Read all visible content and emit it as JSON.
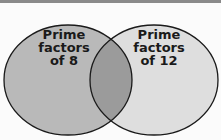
{
  "diagram": {
    "type": "venn",
    "sets": [
      {
        "label_lines": [
          "Prime",
          "factors",
          "of 8"
        ],
        "color": "#b9b9b9"
      },
      {
        "label_lines": [
          "Prime",
          "factors",
          "of 12"
        ],
        "color": "#dedede"
      }
    ],
    "overlap_color": "#9b9b9b",
    "stroke_color": "#1a1a1a"
  }
}
